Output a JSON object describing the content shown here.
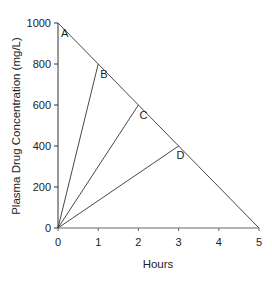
{
  "chart_data": {
    "type": "line",
    "title": "",
    "xlabel": "Hours",
    "ylabel": "Plasma Drug Concentration (mg/L)",
    "xlim": [
      0,
      5
    ],
    "ylim": [
      0,
      1000
    ],
    "grid": false,
    "legend": null,
    "x_ticks": [
      "0",
      "1",
      "2",
      "3",
      "4",
      "5"
    ],
    "y_ticks": [
      "0",
      "200",
      "400",
      "600",
      "800",
      "1000"
    ],
    "series": [
      {
        "name": "Elimination line A",
        "points": [
          [
            0,
            1000
          ],
          [
            5,
            0
          ]
        ]
      },
      {
        "name": "Line to B",
        "points": [
          [
            0,
            0
          ],
          [
            1,
            800
          ]
        ]
      },
      {
        "name": "Line to C",
        "points": [
          [
            0,
            0
          ],
          [
            2,
            600
          ]
        ]
      },
      {
        "name": "Line to D",
        "points": [
          [
            0,
            0
          ],
          [
            3,
            400
          ]
        ]
      }
    ],
    "annotations": [
      {
        "text": "A",
        "x": 0,
        "y": 1000
      },
      {
        "text": "B",
        "x": 1,
        "y": 800
      },
      {
        "text": "C",
        "x": 2,
        "y": 600
      },
      {
        "text": "D",
        "x": 3,
        "y": 400
      }
    ]
  }
}
